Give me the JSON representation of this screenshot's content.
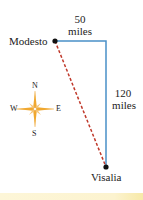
{
  "diagram": {
    "cities": {
      "start": "Modesto",
      "end": "Visalia"
    },
    "legs": {
      "east": {
        "value": "50",
        "unit": "miles"
      },
      "south": {
        "value": "120",
        "unit": "miles"
      }
    },
    "compass": {
      "n": "N",
      "s": "S",
      "e": "E",
      "w": "W"
    },
    "colors": {
      "route": "#4a90c8",
      "direct": "#c0392b",
      "compass": "#f0a830"
    }
  }
}
